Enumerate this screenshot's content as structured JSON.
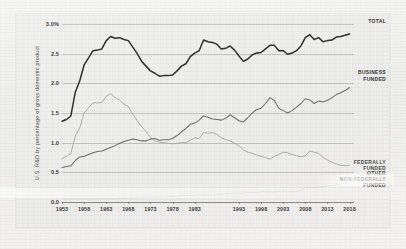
{
  "chart_data": {
    "type": "line",
    "title": "",
    "xlabel": "",
    "ylabel": "U.S. R&D by percentage of gross domestic product",
    "xlim": [
      1953,
      2019
    ],
    "ylim": [
      0.0,
      3.0
    ],
    "grid": true,
    "legend_position": "right-inline-annotations",
    "ytick_labels": [
      "0.0",
      "0.5",
      "1.0",
      "1.5",
      "2.0",
      "2.5",
      "3.0%"
    ],
    "ytick_values": [
      0.0,
      0.5,
      1.0,
      1.5,
      2.0,
      2.5,
      3.0
    ],
    "xtick_labels": [
      "1953",
      "1958",
      "1963",
      "1968",
      "1973",
      "1978",
      "1983",
      "1993",
      "1998",
      "2003",
      "2008",
      "2013",
      "2018"
    ],
    "xtick_values": [
      1953,
      1958,
      1963,
      1968,
      1973,
      1978,
      1983,
      1993,
      1998,
      2003,
      2008,
      2013,
      2018
    ],
    "x": [
      1953,
      1954,
      1955,
      1956,
      1957,
      1958,
      1959,
      1960,
      1961,
      1962,
      1963,
      1964,
      1965,
      1966,
      1967,
      1968,
      1969,
      1970,
      1971,
      1972,
      1973,
      1974,
      1975,
      1976,
      1977,
      1978,
      1979,
      1980,
      1981,
      1982,
      1983,
      1984,
      1985,
      1986,
      1987,
      1988,
      1989,
      1990,
      1991,
      1992,
      1993,
      1994,
      1995,
      1996,
      1997,
      1998,
      1999,
      2000,
      2001,
      2002,
      2003,
      2004,
      2005,
      2006,
      2007,
      2008,
      2009,
      2010,
      2011,
      2012,
      2013,
      2014,
      2015,
      2016,
      2017,
      2018
    ],
    "series": [
      {
        "name": "TOTAL",
        "color": "#2f2f2f",
        "label_lines": [
          "TOTAL"
        ],
        "values": [
          1.36,
          1.39,
          1.45,
          1.85,
          2.04,
          2.31,
          2.43,
          2.55,
          2.56,
          2.58,
          2.72,
          2.79,
          2.76,
          2.77,
          2.74,
          2.72,
          2.61,
          2.5,
          2.37,
          2.29,
          2.21,
          2.17,
          2.12,
          2.13,
          2.13,
          2.14,
          2.21,
          2.29,
          2.33,
          2.45,
          2.51,
          2.55,
          2.73,
          2.7,
          2.69,
          2.66,
          2.58,
          2.59,
          2.63,
          2.56,
          2.46,
          2.37,
          2.41,
          2.48,
          2.51,
          2.52,
          2.58,
          2.64,
          2.64,
          2.55,
          2.55,
          2.49,
          2.51,
          2.55,
          2.63,
          2.77,
          2.82,
          2.74,
          2.77,
          2.7,
          2.72,
          2.73,
          2.78,
          2.79,
          2.81,
          2.83
        ]
      },
      {
        "name": "BUSINESS FUNDED",
        "color": "#6e6e6e",
        "label_lines": [
          "BUSINESS",
          "FUNDED"
        ],
        "values": [
          0.58,
          0.6,
          0.61,
          0.7,
          0.76,
          0.77,
          0.8,
          0.83,
          0.85,
          0.86,
          0.89,
          0.92,
          0.95,
          0.99,
          1.02,
          1.04,
          1.06,
          1.05,
          1.03,
          1.03,
          1.06,
          1.07,
          1.04,
          1.05,
          1.05,
          1.07,
          1.12,
          1.18,
          1.24,
          1.31,
          1.33,
          1.38,
          1.45,
          1.43,
          1.4,
          1.39,
          1.38,
          1.41,
          1.47,
          1.42,
          1.37,
          1.35,
          1.42,
          1.5,
          1.56,
          1.58,
          1.66,
          1.76,
          1.71,
          1.58,
          1.54,
          1.5,
          1.54,
          1.6,
          1.66,
          1.74,
          1.72,
          1.66,
          1.7,
          1.69,
          1.71,
          1.76,
          1.81,
          1.84,
          1.88,
          1.93
        ]
      },
      {
        "name": "FEDERALLY FUNDED",
        "color": "#a8a8a8",
        "label_lines": [
          "FEDERALLY",
          "FUNDED"
        ],
        "values": [
          0.73,
          0.77,
          0.82,
          1.11,
          1.25,
          1.5,
          1.59,
          1.67,
          1.67,
          1.68,
          1.78,
          1.83,
          1.76,
          1.72,
          1.65,
          1.61,
          1.48,
          1.37,
          1.27,
          1.19,
          1.09,
          1.03,
          1.01,
          1.0,
          0.99,
          0.98,
          0.99,
          1.0,
          1.0,
          1.04,
          1.08,
          1.07,
          1.17,
          1.16,
          1.17,
          1.14,
          1.08,
          1.05,
          1.03,
          0.99,
          0.95,
          0.88,
          0.84,
          0.82,
          0.79,
          0.77,
          0.75,
          0.72,
          0.77,
          0.8,
          0.84,
          0.83,
          0.8,
          0.78,
          0.76,
          0.78,
          0.86,
          0.84,
          0.82,
          0.75,
          0.71,
          0.67,
          0.64,
          0.62,
          0.61,
          0.62
        ]
      },
      {
        "name": "OTHER NON-FEDERALLY FUNDED",
        "color": "#d4d4d4",
        "label_lines": [
          "OTHER",
          "NON-FEDERALLY",
          "FUNDED"
        ],
        "values": [
          0.05,
          0.05,
          0.05,
          0.05,
          0.05,
          0.05,
          0.05,
          0.05,
          0.05,
          0.05,
          0.05,
          0.05,
          0.05,
          0.06,
          0.07,
          0.07,
          0.07,
          0.08,
          0.08,
          0.08,
          0.08,
          0.08,
          0.08,
          0.08,
          0.09,
          0.09,
          0.1,
          0.11,
          0.11,
          0.11,
          0.11,
          0.12,
          0.12,
          0.12,
          0.12,
          0.13,
          0.13,
          0.14,
          0.14,
          0.15,
          0.15,
          0.15,
          0.16,
          0.16,
          0.16,
          0.17,
          0.17,
          0.17,
          0.17,
          0.18,
          0.18,
          0.17,
          0.18,
          0.18,
          0.2,
          0.24,
          0.25,
          0.24,
          0.25,
          0.26,
          0.27,
          0.28,
          0.29,
          0.3,
          0.31,
          0.31
        ]
      }
    ],
    "annotations": [
      {
        "text": "TOTAL",
        "series": "TOTAL"
      },
      {
        "text": "BUSINESS FUNDED",
        "series": "BUSINESS FUNDED"
      },
      {
        "text": "FEDERALLY FUNDED",
        "series": "FEDERALLY FUNDED"
      },
      {
        "text": "OTHER NON-FEDERALLY FUNDED",
        "series": "OTHER NON-FEDERALLY FUNDED"
      }
    ]
  }
}
